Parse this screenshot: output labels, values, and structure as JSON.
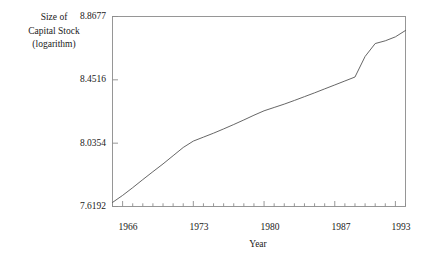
{
  "chart_data": {
    "type": "line",
    "title": "",
    "xlabel": "Year",
    "ylabel": "Size of Capital Stock (logarithm)",
    "ylabel_lines": [
      "Size of",
      "Capital Stock",
      "(logarithm)"
    ],
    "xlim": [
      1965,
      1994
    ],
    "ylim": [
      7.6192,
      8.8677
    ],
    "grid": false,
    "legend": null,
    "ytick_labels": [
      "7.6192",
      "8.0354",
      "8.4516",
      "8.8677"
    ],
    "ytick_values": [
      7.6192,
      8.0354,
      8.4516,
      8.8677
    ],
    "xtick_labels": [
      "1966",
      "1973",
      "1980",
      "1987",
      "1993"
    ],
    "xtick_values": [
      1966,
      1973,
      1980,
      1987,
      1993
    ],
    "xminor_tick_step": 1,
    "line_color": "#555555",
    "frame_color": "#8c8c8c",
    "background_color": "#ffffff",
    "series": [
      {
        "name": "Size of Capital Stock (logarithm)",
        "x": [
          1965,
          1966,
          1967,
          1968,
          1969,
          1970,
          1971,
          1972,
          1973,
          1974,
          1975,
          1976,
          1977,
          1978,
          1979,
          1980,
          1981,
          1982,
          1983,
          1984,
          1985,
          1986,
          1987,
          1988,
          1989,
          1990,
          1991,
          1992,
          1993,
          1994
        ],
        "values": [
          7.646,
          7.692,
          7.743,
          7.796,
          7.848,
          7.899,
          7.953,
          8.007,
          8.049,
          8.075,
          8.101,
          8.129,
          8.158,
          8.188,
          8.219,
          8.248,
          8.27,
          8.292,
          8.316,
          8.341,
          8.366,
          8.392,
          8.418,
          8.444,
          8.47,
          8.605,
          8.69,
          8.708,
          8.734,
          8.776
        ]
      }
    ]
  },
  "axes": {
    "y_axis_name": "capital-stock-log-axis",
    "x_axis_name": "year-axis"
  }
}
